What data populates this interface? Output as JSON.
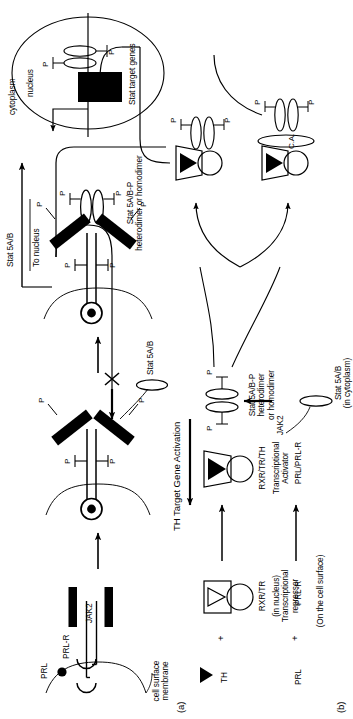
{
  "figure": {
    "domain": "Diagram",
    "orientation": "rotated-90-ccw",
    "canvas": {
      "width": 352,
      "height": 719
    },
    "background": "#ffffff",
    "ink": "#000000"
  },
  "panel_a": {
    "id": "(a)",
    "title_implicit": "PRL / JAK2 / Stat5 signalling at the cell surface",
    "labels": {
      "prl": "PRL",
      "prl_r": "PRL-R",
      "jak2": "JAK2",
      "cell_surface_membrane": "cell surface\nmembrane",
      "stat5ab_cytoplasmic": "Stat 5A/B",
      "stat5ab_to_nucleus_top": "Stat 5A/B",
      "to_nucleus": "To nucleus",
      "stat_dimer": "Stat 5A/B-P\nheterodimer or homodimer",
      "cytoplasm": "cytoplasm",
      "nucleus": "nucleus",
      "stat_target_genes": "Stat target genes",
      "phosphate": "P"
    },
    "phosphate_count_receptor_step2": 4,
    "phosphate_count_receptor_step3": 4,
    "phosphate_count_dimer": 2,
    "phosphate_count_nucleus": 2
  },
  "panel_b": {
    "id": "(b)",
    "title": "TH Target Gene Activation",
    "reaction_1": {
      "reactant_1": "TH",
      "plus": "+",
      "reactant_2": "RXR/TR",
      "reactant_2_sub": "(in nucleus)\nTranscriptional\nrepressor",
      "product": "RXR/TR/TH",
      "product_sub": "Transcriptional\nActivator"
    },
    "reaction_2": {
      "reactant_1": "PRL",
      "plus": "+",
      "reactant_2": "PRL-R",
      "reactant_2_sub": "(On the cell surface)",
      "product": "PRL/PRL-R",
      "kinase": "JAK2",
      "stat_cytoplasmic": "Stat 5A/B\n(in cytoplasm)"
    },
    "stat_dimer_label": "Stat 5A/B-P\nheterodimer\nor homodimer",
    "coactivator": "C.A.",
    "phosphate": "P",
    "blocked_marker": "X",
    "blocked_meaning": "activation blocked"
  }
}
